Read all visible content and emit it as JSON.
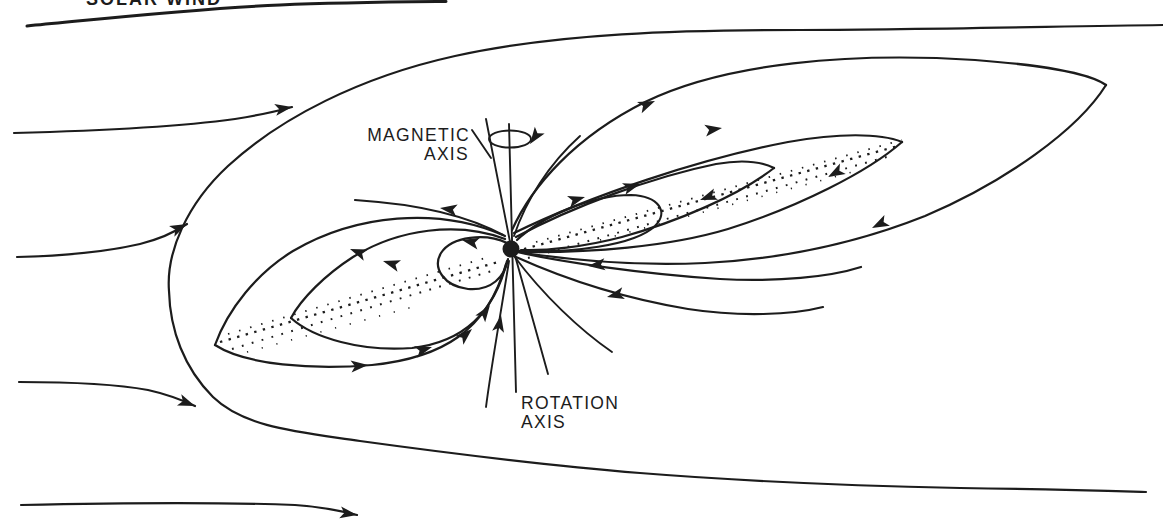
{
  "figure": {
    "kind": "hand-drawn magnetosphere line diagram",
    "ink": "#1c1c1c",
    "paper": "#ffffff",
    "labels": {
      "solar_wind": "SOLAR WIND",
      "magnetic_axis_line1": "MAGNETIC",
      "magnetic_axis_line2": "AXIS",
      "rotation_axis_line1": "ROTATION",
      "rotation_axis_line2": "AXIS"
    }
  }
}
